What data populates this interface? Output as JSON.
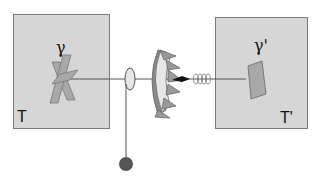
{
  "diagram": {
    "left_reservoir": {
      "label": "T",
      "vane_label": "γ",
      "fill": "#d6d6d6"
    },
    "right_reservoir": {
      "label": "T'",
      "paddle_label": "γ'",
      "fill": "#d6d6d6"
    },
    "components": [
      "vanes",
      "axle",
      "wheel",
      "ratchet",
      "pawl",
      "spring",
      "paddle",
      "weight"
    ],
    "colors": {
      "box_fill": "#d6d6d6",
      "box_border": "#7a7a7a",
      "part_fill": "#a8a8a8",
      "ratchet_dark": "#8a8a8a",
      "weight": "#555555"
    }
  }
}
